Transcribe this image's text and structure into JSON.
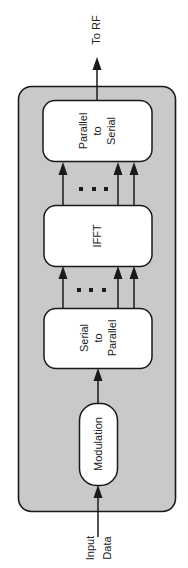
{
  "diagram": {
    "colors": {
      "container_fill": "#c9c9c9",
      "block_fill": "#ffffff",
      "stroke": "#1a1a1a",
      "text": "#222222"
    },
    "input_label": {
      "line1": "Input",
      "line2": "Data"
    },
    "output_label": "To RF",
    "blocks": [
      {
        "id": "modulation",
        "lines": [
          "Modulation"
        ]
      },
      {
        "id": "serial-to-parallel",
        "lines": [
          "Serial",
          "to",
          "Parallel"
        ]
      },
      {
        "id": "ifft",
        "lines": [
          "IFFT"
        ]
      },
      {
        "id": "parallel-to-serial",
        "lines": [
          "Parallel",
          "to",
          "Serial"
        ]
      }
    ],
    "ellipsis": "..."
  }
}
